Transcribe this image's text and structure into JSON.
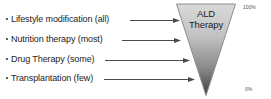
{
  "diagram": {
    "funnel": {
      "line1": "ALD",
      "line2": "Therapy",
      "fill_top": "#d4d4d4",
      "fill_bottom": "#4a4a4a",
      "stroke": "#7a7a7a"
    },
    "scale": {
      "top_label": "100%",
      "bottom_label": "0%"
    },
    "items": [
      {
        "label": "Lifestyle modification (all)"
      },
      {
        "label": "Nutrition therapy (most)"
      },
      {
        "label": "Drug Therapy (some)"
      },
      {
        "label": "Transplantation (few)"
      }
    ]
  }
}
